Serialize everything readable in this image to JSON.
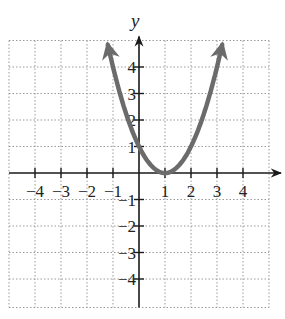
{
  "chart_data": {
    "type": "line",
    "title": "",
    "function": "y = (x - 1)^2",
    "xlabel": "x",
    "ylabel": "y",
    "xlim": [
      -5,
      5
    ],
    "ylim": [
      -5,
      5
    ],
    "grid": true,
    "grid_style": "dotted",
    "x_ticks": [
      -4,
      -3,
      -2,
      -1,
      1,
      2,
      3,
      4
    ],
    "y_ticks": [
      4,
      3,
      2,
      1,
      -1,
      -2,
      -3,
      -4
    ],
    "x_tick_labels": [
      "−4",
      "−3",
      "−2",
      "−1",
      "1",
      "2",
      "3",
      "4"
    ],
    "y_tick_labels": [
      "4",
      "3",
      "2",
      "1",
      "−1",
      "−2",
      "−3",
      "−4"
    ],
    "series": [
      {
        "name": "parabola",
        "color": "#6b6b6b",
        "x": [
          -1.2,
          -1,
          -0.5,
          0,
          0.5,
          1,
          1.5,
          2,
          2.5,
          3,
          3.2
        ],
        "y": [
          4.84,
          4,
          2.25,
          1,
          0.25,
          0,
          0.25,
          1,
          2.25,
          4,
          4.84
        ],
        "vertex": [
          1,
          0
        ],
        "arrows_both_ends": true
      }
    ]
  },
  "colors": {
    "curve": "#6b6b6b",
    "axes": "#1a1a1a",
    "grid": "#9a9a9a"
  }
}
